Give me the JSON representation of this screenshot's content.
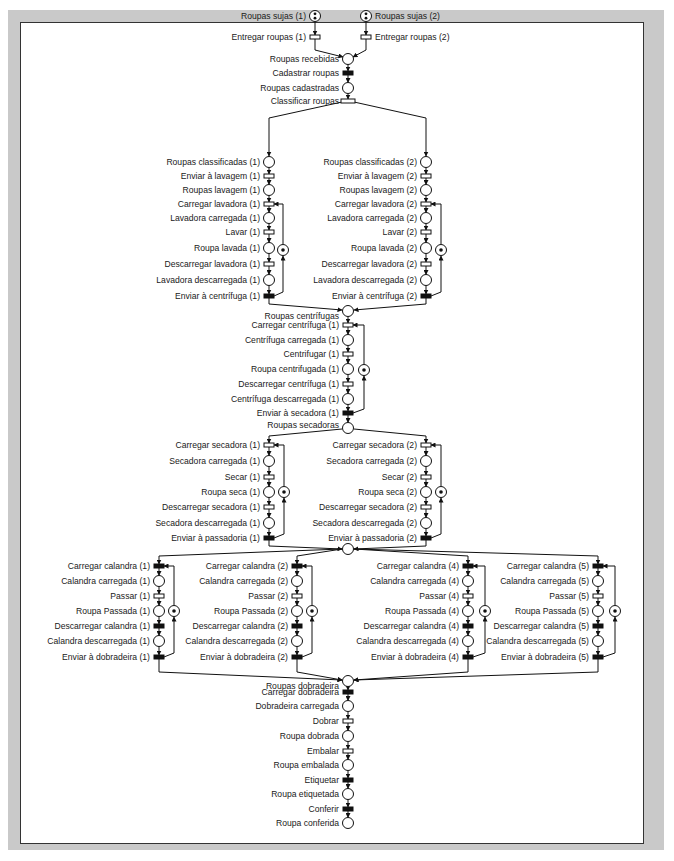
{
  "figure": {
    "type": "petri-net"
  },
  "intake": {
    "places": {
      "sujas1": "Roupas sujas (1)",
      "sujas2": "Roupas sujas (2)",
      "recebidas": "Roupas recebidas",
      "cadastradas": "Roupas cadastradas"
    },
    "transitions": {
      "entregar1": "Entregar roupas (1)",
      "entregar2": "Entregar roupas (2)",
      "cadastrar": "Cadastrar roupas",
      "classificar": "Classificar roupas"
    }
  },
  "washing": [
    {
      "rows": [
        "Roupas classificadas (1)",
        "Enviar à lavagem (1)",
        "Roupas lavagem (1)",
        "Carregar lavadora (1)",
        "Lavadora carregada (1)",
        "Lavar (1)",
        "Roupa lavada (1)",
        "Descarregar lavadora (1)",
        "Lavadora descarregada (1)",
        "Enviar à centrífuga (1)"
      ]
    },
    {
      "rows": [
        "Roupas classificadas (2)",
        "Enviar à lavagem (2)",
        "Roupas lavagem (2)",
        "Carregar lavadora (2)",
        "Lavadora carregada (2)",
        "Lavar (2)",
        "Roupa lavada (2)",
        "Descarregar lavadora (2)",
        "Lavadora descarregada (2)",
        "Enviar à centrífuga (2)"
      ]
    }
  ],
  "spinning": {
    "junction": "Roupas centrífugas",
    "rows": [
      "Carregar centrífuga (1)",
      "Centrífuga carregada (1)",
      "Centrifugar (1)",
      "Roupa centrifugada (1)",
      "Descarregar centrífuga (1)",
      "Centrífuga descarregada (1)",
      "Enviar à secadora (1)"
    ]
  },
  "drying": {
    "junction": "Roupas secadoras",
    "columns": [
      {
        "rows": [
          "Carregar secadora (1)",
          "Secadora carregada (1)",
          "Secar (1)",
          "Roupa seca (1)",
          "Descarregar secadora (1)",
          "Secadora descarregada (1)",
          "Enviar à passadoria (1)"
        ]
      },
      {
        "rows": [
          "Carregar secadora (2)",
          "Secadora carregada (2)",
          "Secar (2)",
          "Roupa seca (2)",
          "Descarregar secadora (2)",
          "Secadora descarregada (2)",
          "Enviar à passadoria (2)"
        ]
      }
    ]
  },
  "ironing": {
    "columns": [
      {
        "rows": [
          "Carregar calandra (1)",
          "Calandra carregada (1)",
          "Passar (1)",
          "Roupa Passada (1)",
          "Descarregar calandra (1)",
          "Calandra descarregada (1)",
          "Enviar à dobradeira (1)"
        ]
      },
      {
        "rows": [
          "Carregar calandra (2)",
          "Calandra carregada (2)",
          "Passar (2)",
          "Roupa Passada (2)",
          "Descarregar calandra (2)",
          "Calandra descarregada (2)",
          "Enviar à dobradeira (2)"
        ]
      },
      {
        "rows": [
          "Carregar calandra (4)",
          "Calandra carregada (4)",
          "Passar (4)",
          "Roupa Passada (4)",
          "Descarregar calandra (4)",
          "Calandra descarregada (4)",
          "Enviar à dobradeira (4)"
        ]
      },
      {
        "rows": [
          "Carregar calandra (5)",
          "Calandra carregada (5)",
          "Passar (5)",
          "Roupa Passada (5)",
          "Descarregar calandra (5)",
          "Calandra descarregada (5)",
          "Enviar à dobradeira (5)"
        ]
      }
    ]
  },
  "folding": {
    "junction": "Roupas dobradeira",
    "rows": [
      "Carregar dobradeira",
      "Dobradeira carregada",
      "Dobrar",
      "Roupa dobrada",
      "Embalar",
      "Roupa embalada",
      "Etiquetar",
      "Roupa etiquetada",
      "Conferir",
      "Roupa conferida"
    ]
  }
}
